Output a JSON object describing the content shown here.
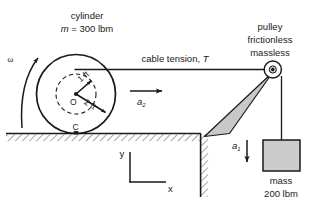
{
  "figure": {
    "title_cylinder_line1": "cylinder",
    "title_cylinder_line2_mass_symbol": "m",
    "title_cylinder_line2_rest": " = 300 lbm",
    "omega_label": "ω",
    "radius_inner_label": "1 ft",
    "radius_outer_label": "2 ft",
    "center_label": "O",
    "contact_label": "C",
    "cable_label_text": "cable tension, ",
    "cable_label_symbol": "T",
    "accel_cylinder_symbol": "a",
    "accel_cylinder_sub": "2",
    "accel_mass_symbol": "a",
    "accel_mass_sub": "1",
    "pulley_line1": "pulley",
    "pulley_line2": "frictionless",
    "pulley_line3": "massless",
    "mass_line1": "mass",
    "mass_line2": "200 lbm",
    "axis_y_label": "y",
    "axis_x_label": "x",
    "colors": {
      "stroke": "#1a1a1a",
      "bracket_fill": "#c8c8c8",
      "mass_fill": "#cccccc",
      "hatch": "#555555",
      "background": "#ffffff"
    }
  }
}
